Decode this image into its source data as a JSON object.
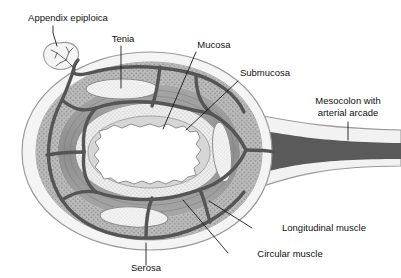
{
  "figure": {
    "background_color": "#ffffff",
    "width": 401,
    "height": 278
  },
  "labels": [
    {
      "id": "appendix-epiploica",
      "text": "Appendix epiploica",
      "text_x": 68,
      "text_y": 21,
      "anchor": "middle",
      "leader": "M 53 26 L 53 33 L 55 45"
    },
    {
      "id": "tenia",
      "text": "Tenia",
      "text_x": 123,
      "text_y": 42,
      "anchor": "middle",
      "leader": "M 121 46 L 121 88"
    },
    {
      "id": "mucosa",
      "text": "Mucosa",
      "text_x": 214,
      "text_y": 48,
      "anchor": "middle",
      "leader": "M 195 52 L 163 129"
    },
    {
      "id": "submucosa",
      "text": "Submucosa",
      "text_x": 265,
      "text_y": 76,
      "anchor": "middle",
      "leader": "M 237 80 L 185 129"
    },
    {
      "id": "mesocolon",
      "text": "Mesocolon with",
      "text_x": 348,
      "text_y": 104,
      "anchor": "middle",
      "leader": ""
    },
    {
      "id": "mesocolon-2",
      "text": "arterial arcade",
      "text_x": 348,
      "text_y": 116,
      "anchor": "middle",
      "leader": "M 348 122 L 348 140"
    },
    {
      "id": "longitudinal-muscle",
      "text": "Longitudinal muscle",
      "text_x": 324,
      "text_y": 231,
      "anchor": "middle",
      "leader": "M 252 228 L 209 201"
    },
    {
      "id": "circular-muscle",
      "text": "Circular muscle",
      "text_x": 290,
      "text_y": 257,
      "anchor": "middle",
      "leader": "M 228 253 L 183 200"
    },
    {
      "id": "serosa",
      "text": "Serosa",
      "text_x": 146,
      "text_y": 271,
      "anchor": "middle",
      "leader": "M 146 265 L 146 243"
    }
  ],
  "structures": {
    "serosa_layer": "outer thin pale envelope",
    "longitudinal_muscle_layer": "mid-gray stippled band",
    "circular_muscle_layer": "darker gray banded ring",
    "submucosa_layer": "pale stippled ring",
    "mucosa_layer": "wavy inner lining",
    "lumen": "white central cavity",
    "tenia_coli_count": 3,
    "appendix_epiploica": "small lobed fat tag with branching vessels at upper left",
    "mesocolon": "dark arterial band extending to the right"
  },
  "colors": {
    "serosa": "#f0f0f0",
    "longitudinal_muscle": "#b4b4b4",
    "circular_muscle": "#9c9c9c",
    "submucosa": "#ebebeb",
    "mucosa": "#d8d8d8",
    "tenia": "#f2f2f2",
    "vessel": "#555555",
    "lumen": "#ffffff",
    "label_text": "#111111"
  }
}
